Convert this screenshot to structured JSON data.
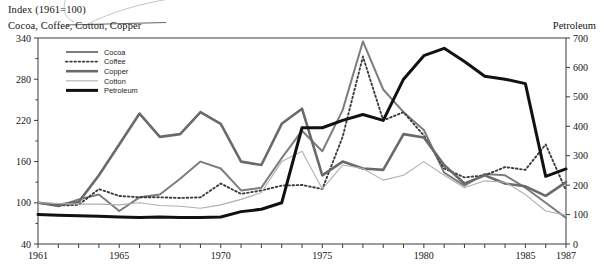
{
  "header": {
    "index_title": "Index (1961=100)",
    "left_axis_title": "Cocoa, Coffee, Cotton, Copper",
    "right_axis_title": "Petroleum"
  },
  "legend": {
    "position": "top-left-inside",
    "entries": [
      {
        "label": "Cocoa",
        "color": "#7d7d7d",
        "width": 2.0,
        "dash": "none"
      },
      {
        "label": "Coffee",
        "color": "#3c3c3c",
        "width": 1.9,
        "dash": "dotted"
      },
      {
        "label": "Copper",
        "color": "#6a6a6a",
        "width": 2.6,
        "dash": "none"
      },
      {
        "label": "Cotton",
        "color": "#b0b0b0",
        "width": 1.1,
        "dash": "none"
      },
      {
        "label": "Petroleum",
        "color": "#111111",
        "width": 3.0,
        "dash": "none"
      }
    ]
  },
  "chart_data": {
    "type": "line",
    "title": "Index (1961=100)",
    "subtitle": "Cocoa, Coffee, Cotton, Copper",
    "xlabel": "",
    "ylabel": "Cocoa, Coffee, Cotton, Copper",
    "y2label": "Petroleum",
    "grid": false,
    "legend_position": "upper left",
    "x": [
      1961,
      1962,
      1963,
      1964,
      1965,
      1966,
      1967,
      1968,
      1969,
      1970,
      1971,
      1972,
      1973,
      1974,
      1975,
      1976,
      1977,
      1978,
      1979,
      1980,
      1981,
      1982,
      1983,
      1984,
      1985,
      1986,
      1987
    ],
    "xlim": [
      1961,
      1987
    ],
    "xticks_labeled": [
      1961,
      1965,
      1970,
      1975,
      1980,
      1985,
      1987
    ],
    "xtick_interval": 1,
    "ylim": [
      40,
      340
    ],
    "yticks": [
      40,
      100,
      160,
      220,
      280,
      340
    ],
    "y2lim": [
      0,
      700
    ],
    "y2ticks": [
      0,
      100,
      200,
      300,
      400,
      500,
      600,
      700
    ],
    "series": [
      {
        "name": "Cocoa",
        "axis": "left",
        "color": "#7d7d7d",
        "values": [
          100,
          95,
          105,
          112,
          88,
          108,
          112,
          135,
          160,
          150,
          118,
          122,
          165,
          205,
          175,
          235,
          335,
          265,
          232,
          206,
          144,
          125,
          142,
          140,
          122,
          100,
          78
        ]
      },
      {
        "name": "Coffee",
        "axis": "left",
        "color": "#3c3c3c",
        "values": [
          100,
          96,
          97,
          120,
          110,
          108,
          108,
          107,
          108,
          128,
          113,
          118,
          125,
          126,
          120,
          196,
          313,
          220,
          232,
          198,
          150,
          137,
          140,
          152,
          148,
          185,
          118
        ]
      },
      {
        "name": "Copper",
        "axis": "left",
        "color": "#6a6a6a",
        "values": [
          100,
          97,
          101,
          140,
          185,
          230,
          196,
          200,
          232,
          215,
          160,
          155,
          215,
          237,
          140,
          160,
          150,
          148,
          200,
          195,
          155,
          128,
          140,
          128,
          124,
          110,
          130
        ]
      },
      {
        "name": "Cotton",
        "axis": "left",
        "color": "#b0b0b0",
        "values": [
          100,
          99,
          98,
          98,
          97,
          100,
          96,
          95,
          92,
          97,
          105,
          115,
          160,
          175,
          120,
          155,
          150,
          133,
          140,
          160,
          140,
          122,
          132,
          130,
          112,
          88,
          82
        ]
      },
      {
        "name": "Petroleum",
        "axis": "right",
        "color": "#111111",
        "values": [
          100,
          98,
          96,
          94,
          92,
          90,
          92,
          90,
          90,
          92,
          110,
          118,
          140,
          395,
          395,
          420,
          440,
          420,
          560,
          640,
          665,
          620,
          570,
          560,
          545,
          230,
          255
        ]
      }
    ]
  }
}
